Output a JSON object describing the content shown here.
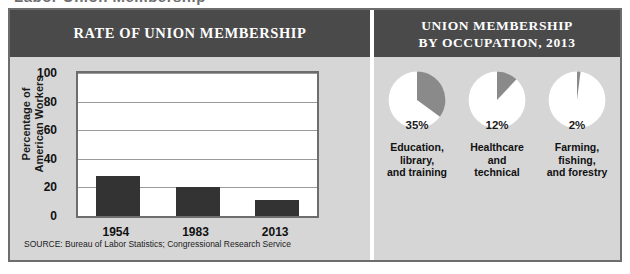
{
  "artifact_text": "Labor Union Membership",
  "colors": {
    "header_bg": "#4a4a4a",
    "panel_bg": "#d6d6d6",
    "frame_border": "#6d6d6d",
    "bar_fill": "#333333",
    "pie_slice": "#8a8a8a",
    "pie_rest": "#ffffff",
    "text_dark": "#111111",
    "text_light": "#ffffff"
  },
  "left": {
    "header": "RATE OF UNION MEMBERSHIP",
    "source": "SOURCE: Bureau of Labor Statistics; Congressional Research Service"
  },
  "right": {
    "header_line1": "UNION MEMBERSHIP",
    "header_line2": "BY OCCUPATION, 2013"
  },
  "chart_data": [
    {
      "type": "bar",
      "title": "RATE OF UNION MEMBERSHIP",
      "xlabel": "",
      "ylabel": "Percentage of American Workers",
      "ylabel_line1": "Percentage of",
      "ylabel_line2": "American Workers",
      "categories": [
        "1954",
        "1983",
        "2013"
      ],
      "values": [
        28,
        20,
        11
      ],
      "ylim": [
        0,
        100
      ],
      "yticks": [
        0,
        20,
        40,
        60,
        80,
        100
      ],
      "grid": true,
      "legend": "none",
      "source": "SOURCE: Bureau of Labor Statistics; Congressional Research Service"
    },
    {
      "type": "pie",
      "title": "UNION MEMBERSHIP BY OCCUPATION, 2013",
      "legend": "none",
      "slices": [
        {
          "label": "Education, library, and training",
          "label_lines": [
            "Education,",
            "library,",
            "and training"
          ],
          "value": 35,
          "value_text": "35%"
        },
        {
          "label": "Healthcare and technical",
          "label_lines": [
            "Healthcare",
            "and",
            "technical"
          ],
          "value": 12,
          "value_text": "12%"
        },
        {
          "label": "Farming, fishing, and forestry",
          "label_lines": [
            "Farming,",
            "fishing,",
            "and forestry"
          ],
          "value": 2,
          "value_text": "2%"
        }
      ]
    }
  ]
}
